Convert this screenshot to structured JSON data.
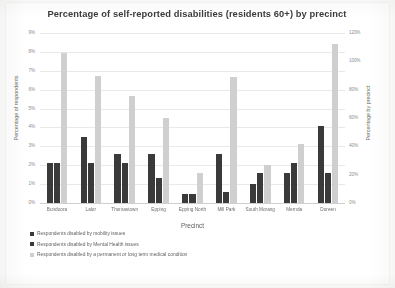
{
  "chart_data": {
    "type": "bar",
    "title": "Percentage of self-reported disabilities (residents 60+) by precinct",
    "xlabel": "Precinct",
    "ylabel": "Percentage of respondents",
    "ylabel_secondary": "Percentage by precinct",
    "grid": true,
    "legend_position": "bottom-left",
    "categories": [
      "Bundoora",
      "Lalor",
      "Thomastown",
      "Epping",
      "Epping North",
      "Mill Park",
      "South Morang",
      "Mernda",
      "Doreen"
    ],
    "ylim": [
      0,
      9
    ],
    "yticks": [
      "0%",
      "1%",
      "2%",
      "3%",
      "4%",
      "5%",
      "6%",
      "7%",
      "8%",
      "9%"
    ],
    "ylim_secondary": [
      0,
      120
    ],
    "yticks_secondary": [
      "0%",
      "20%",
      "40%",
      "60%",
      "80%",
      "100%",
      "120%"
    ],
    "series": [
      {
        "name": "Respondents disabled by mobility issues",
        "axis": "left",
        "color": "#3a3a3a",
        "values": [
          2.1,
          3.5,
          2.6,
          2.6,
          0.5,
          2.6,
          1.0,
          1.6,
          4.1
        ]
      },
      {
        "name": "Respondents disabled by Mental Health issues",
        "axis": "left",
        "color": "#3a3a3a",
        "values": [
          2.1,
          2.1,
          2.1,
          1.3,
          0.5,
          0.6,
          1.6,
          2.1,
          1.6
        ]
      },
      {
        "name": "Respondents disabled by a permanent or long term medical condition",
        "axis": "right",
        "color": "#cfcfcf",
        "values": [
          106.0,
          90.0,
          75.5,
          60.0,
          21.5,
          89.0,
          27.0,
          42.0,
          112.0
        ]
      }
    ]
  }
}
